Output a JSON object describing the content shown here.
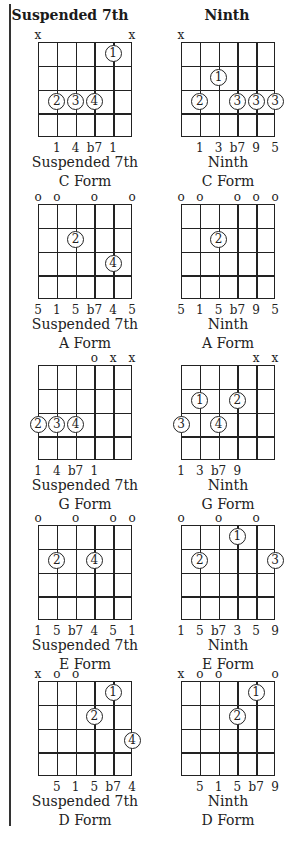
{
  "columns": [
    {
      "title": "Suspended 7th"
    },
    {
      "title": "Ninth"
    }
  ],
  "chart_data": {
    "type": "table",
    "strings": [
      "E",
      "A",
      "D",
      "G",
      "B",
      "e"
    ],
    "frets_shown": 4,
    "chords": [
      {
        "col": 0,
        "row": 0,
        "name": "Suspended 7th",
        "form": "C Form",
        "string_marks": [
          "x",
          "",
          "",
          "",
          "",
          "x"
        ],
        "fingers": [
          {
            "string": 5,
            "fret": 1,
            "finger": "1"
          },
          {
            "string": 2,
            "fret": 3,
            "finger": "2"
          },
          {
            "string": 3,
            "fret": 3,
            "finger": "3"
          },
          {
            "string": 4,
            "fret": 3,
            "finger": "4"
          }
        ],
        "degrees": [
          "",
          "1",
          "4",
          "b7",
          "1",
          ""
        ]
      },
      {
        "col": 1,
        "row": 0,
        "name": "Ninth",
        "form": "C Form",
        "string_marks": [
          "x",
          "",
          "",
          "",
          "",
          ""
        ],
        "fingers": [
          {
            "string": 3,
            "fret": 2,
            "finger": "1"
          },
          {
            "string": 2,
            "fret": 3,
            "finger": "2"
          },
          {
            "string": 4,
            "fret": 3,
            "finger": "3"
          },
          {
            "string": 5,
            "fret": 3,
            "finger": "3"
          },
          {
            "string": 6,
            "fret": 3,
            "finger": "3"
          }
        ],
        "degrees": [
          "",
          "1",
          "3",
          "b7",
          "9",
          "5"
        ]
      },
      {
        "col": 0,
        "row": 1,
        "name": "Suspended 7th",
        "form": "A Form",
        "string_marks": [
          "o",
          "o",
          "",
          "o",
          "",
          "o"
        ],
        "fingers": [
          {
            "string": 3,
            "fret": 2,
            "finger": "2"
          },
          {
            "string": 5,
            "fret": 3,
            "finger": "4"
          }
        ],
        "degrees": [
          "5",
          "1",
          "5",
          "b7",
          "4",
          "5"
        ]
      },
      {
        "col": 1,
        "row": 1,
        "name": "Ninth",
        "form": "A Form",
        "string_marks": [
          "o",
          "o",
          "",
          "o",
          "o",
          "o"
        ],
        "fingers": [
          {
            "string": 3,
            "fret": 2,
            "finger": "2"
          }
        ],
        "degrees": [
          "5",
          "1",
          "5",
          "b7",
          "9",
          "5"
        ]
      },
      {
        "col": 0,
        "row": 2,
        "name": "Suspended 7th",
        "form": "G Form",
        "string_marks": [
          "",
          "",
          "",
          "o",
          "x",
          "x"
        ],
        "fingers": [
          {
            "string": 1,
            "fret": 3,
            "finger": "2"
          },
          {
            "string": 2,
            "fret": 3,
            "finger": "3"
          },
          {
            "string": 3,
            "fret": 3,
            "finger": "4"
          }
        ],
        "degrees": [
          "1",
          "4",
          "b7",
          "1",
          "",
          ""
        ]
      },
      {
        "col": 1,
        "row": 2,
        "name": "Ninth",
        "form": "G Form",
        "string_marks": [
          "",
          "",
          "",
          "",
          "x",
          "x"
        ],
        "fingers": [
          {
            "string": 2,
            "fret": 2,
            "finger": "1"
          },
          {
            "string": 4,
            "fret": 2,
            "finger": "2"
          },
          {
            "string": 1,
            "fret": 3,
            "finger": "3"
          },
          {
            "string": 3,
            "fret": 3,
            "finger": "4"
          }
        ],
        "degrees": [
          "1",
          "3",
          "b7",
          "9",
          "",
          ""
        ]
      },
      {
        "col": 0,
        "row": 3,
        "name": "Suspended 7th",
        "form": "E Form",
        "string_marks": [
          "o",
          "",
          "o",
          "",
          "o",
          "o"
        ],
        "fingers": [
          {
            "string": 2,
            "fret": 2,
            "finger": "2"
          },
          {
            "string": 4,
            "fret": 2,
            "finger": "4"
          }
        ],
        "degrees": [
          "1",
          "5",
          "b7",
          "4",
          "5",
          "1"
        ]
      },
      {
        "col": 1,
        "row": 3,
        "name": "Ninth",
        "form": "E Form",
        "string_marks": [
          "o",
          "",
          "o",
          "",
          "o",
          ""
        ],
        "fingers": [
          {
            "string": 4,
            "fret": 1,
            "finger": "1"
          },
          {
            "string": 2,
            "fret": 2,
            "finger": "2"
          },
          {
            "string": 6,
            "fret": 2,
            "finger": "3"
          }
        ],
        "degrees": [
          "1",
          "5",
          "b7",
          "3",
          "5",
          "9"
        ]
      },
      {
        "col": 0,
        "row": 4,
        "name": "Suspended 7th",
        "form": "D Form",
        "string_marks": [
          "x",
          "o",
          "o",
          "",
          "",
          ""
        ],
        "fingers": [
          {
            "string": 5,
            "fret": 1,
            "finger": "1"
          },
          {
            "string": 4,
            "fret": 2,
            "finger": "2"
          },
          {
            "string": 6,
            "fret": 3,
            "finger": "4"
          }
        ],
        "degrees": [
          "",
          "5",
          "1",
          "5",
          "b7",
          "4"
        ]
      },
      {
        "col": 1,
        "row": 4,
        "name": "Ninth",
        "form": "D Form",
        "string_marks": [
          "x",
          "o",
          "o",
          "",
          "",
          "o"
        ],
        "fingers": [
          {
            "string": 5,
            "fret": 1,
            "finger": "1"
          },
          {
            "string": 4,
            "fret": 2,
            "finger": "2"
          }
        ],
        "degrees": [
          "",
          "5",
          "1",
          "5",
          "b7",
          "9"
        ]
      }
    ]
  }
}
